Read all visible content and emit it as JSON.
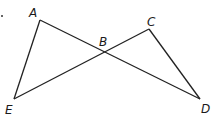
{
  "diagram": {
    "points": {
      "A": {
        "label": "A",
        "x": 40,
        "y": 20,
        "lx": 29,
        "ly": 17
      },
      "B": {
        "label": "B",
        "x": 104,
        "y": 52,
        "lx": 99,
        "ly": 46
      },
      "C": {
        "label": "C",
        "x": 149,
        "y": 29,
        "lx": 147,
        "ly": 26
      },
      "D": {
        "label": "D",
        "x": 200,
        "y": 99,
        "lx": 201,
        "ly": 113
      },
      "E": {
        "label": "E",
        "x": 14,
        "y": 99,
        "lx": 5,
        "ly": 114
      }
    },
    "segments": [
      [
        "A",
        "E"
      ],
      [
        "A",
        "D"
      ],
      [
        "E",
        "C"
      ],
      [
        "C",
        "D"
      ]
    ]
  }
}
